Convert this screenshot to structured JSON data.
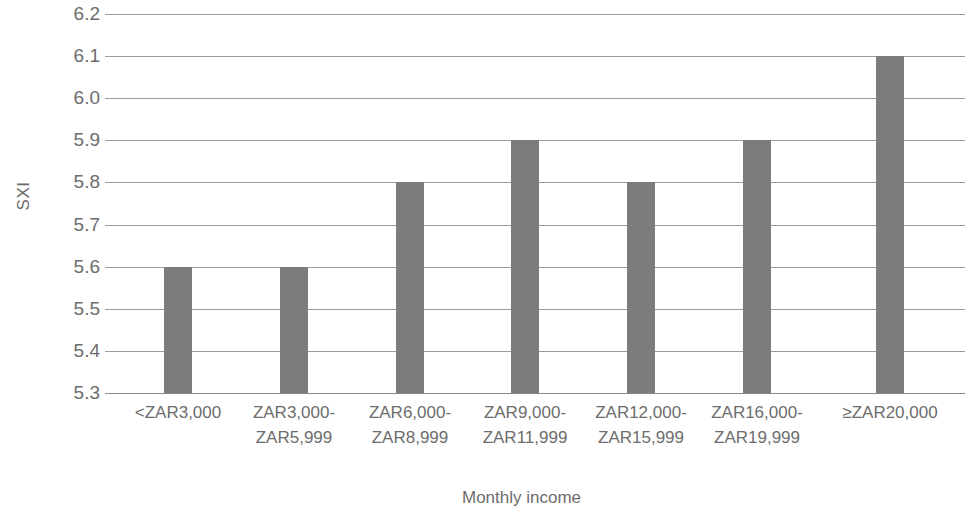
{
  "chart_data": {
    "type": "bar",
    "title": "",
    "subtitle": "",
    "xlabel": "Monthly income",
    "ylabel": "SXI",
    "categories": [
      "<ZAR3,000",
      "ZAR3,000-\nZAR5,999",
      "ZAR6,000-\nZAR8,999",
      "ZAR9,000-\nZAR11,999",
      "ZAR12,000-\nZAR15,999",
      "ZAR16,000-\nZAR19,999",
      "≥ZAR20,000"
    ],
    "values": [
      5.6,
      5.6,
      5.8,
      5.9,
      5.8,
      5.9,
      6.1
    ],
    "ylim": [
      5.3,
      6.2
    ],
    "ytick_labels": [
      "6.2",
      "6.1",
      "6.0",
      "5.9",
      "5.8",
      "5.7",
      "5.6",
      "5.5",
      "5.4",
      "5.3"
    ],
    "ytick_values": [
      6.2,
      6.1,
      6.0,
      5.9,
      5.8,
      5.7,
      5.6,
      5.5,
      5.4,
      5.3
    ],
    "ytick_step": 0.1,
    "grid": true,
    "grid_axis": "y",
    "legend": false,
    "legend_position": "none",
    "bar_color": "#7c7c7c",
    "grid_color": "#9a9a9a",
    "text_color": "#6d6d6d",
    "background_color": "#ffffff",
    "annotations": []
  }
}
